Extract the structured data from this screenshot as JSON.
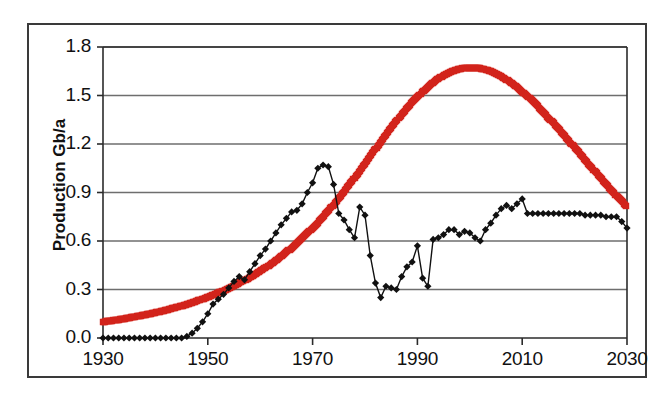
{
  "chart_data": {
    "type": "line",
    "title": "",
    "xlabel": "",
    "ylabel": "Production Gb/a",
    "xlim": [
      1930,
      2030
    ],
    "ylim": [
      0.0,
      1.8
    ],
    "grid": true,
    "legend": "none",
    "xticks": [
      "1930",
      "1950",
      "1970",
      "1990",
      "2010",
      "2030"
    ],
    "xtick_values": [
      1930,
      1950,
      1970,
      1990,
      2010,
      2030
    ],
    "yticks": [
      "0.0",
      "0.3",
      "0.6",
      "0.9",
      "1.2",
      "1.5",
      "1.8"
    ],
    "ytick_values": [
      0.0,
      0.3,
      0.6,
      0.9,
      1.2,
      1.5,
      1.8
    ],
    "series": [
      {
        "name": "model-curve",
        "style": "thick-red-bell-curve",
        "color": "#D2241C",
        "marker": "square",
        "x": [
          1930,
          1931,
          1932,
          1933,
          1934,
          1935,
          1936,
          1937,
          1938,
          1939,
          1940,
          1941,
          1942,
          1943,
          1944,
          1945,
          1946,
          1947,
          1948,
          1949,
          1950,
          1951,
          1952,
          1953,
          1954,
          1955,
          1956,
          1957,
          1958,
          1959,
          1960,
          1961,
          1962,
          1963,
          1964,
          1965,
          1966,
          1967,
          1968,
          1969,
          1970,
          1971,
          1972,
          1973,
          1974,
          1975,
          1976,
          1977,
          1978,
          1979,
          1980,
          1981,
          1982,
          1983,
          1984,
          1985,
          1986,
          1987,
          1988,
          1989,
          1990,
          1991,
          1992,
          1993,
          1994,
          1995,
          1996,
          1997,
          1998,
          1999,
          2000,
          2001,
          2002,
          2003,
          2004,
          2005,
          2006,
          2007,
          2008,
          2009,
          2010,
          2011,
          2012,
          2013,
          2014,
          2015,
          2016,
          2017,
          2018,
          2019,
          2020,
          2021,
          2022,
          2023,
          2024,
          2025,
          2026,
          2027,
          2028,
          2029,
          2030
        ],
        "values": [
          0.1,
          0.104,
          0.109,
          0.114,
          0.119,
          0.125,
          0.131,
          0.137,
          0.143,
          0.15,
          0.157,
          0.165,
          0.173,
          0.181,
          0.19,
          0.199,
          0.209,
          0.219,
          0.23,
          0.241,
          0.253,
          0.266,
          0.279,
          0.293,
          0.308,
          0.323,
          0.34,
          0.357,
          0.375,
          0.394,
          0.414,
          0.435,
          0.457,
          0.48,
          0.505,
          0.531,
          0.558,
          0.586,
          0.616,
          0.647,
          0.68,
          0.714,
          0.75,
          0.787,
          0.825,
          0.865,
          0.906,
          0.948,
          0.991,
          1.035,
          1.079,
          1.124,
          1.169,
          1.214,
          1.258,
          1.301,
          1.343,
          1.383,
          1.422,
          1.459,
          1.493,
          1.525,
          1.554,
          1.58,
          1.604,
          1.624,
          1.641,
          1.654,
          1.664,
          1.67,
          1.673,
          1.672,
          1.668,
          1.66,
          1.649,
          1.635,
          1.618,
          1.598,
          1.576,
          1.551,
          1.524,
          1.495,
          1.464,
          1.432,
          1.398,
          1.363,
          1.327,
          1.291,
          1.254,
          1.216,
          1.178,
          1.14,
          1.102,
          1.064,
          1.026,
          0.989,
          0.952,
          0.916,
          0.88,
          0.845,
          0.811
        ],
        "peak_year": 1994,
        "peak_value": 1.67
      },
      {
        "name": "historical-data",
        "style": "thin-black-line-with-diamond-markers",
        "color": "#111111",
        "marker": "diamond",
        "x": [
          1930,
          1931,
          1932,
          1933,
          1934,
          1935,
          1936,
          1937,
          1938,
          1939,
          1940,
          1941,
          1942,
          1943,
          1944,
          1945,
          1946,
          1947,
          1948,
          1949,
          1950,
          1951,
          1952,
          1953,
          1954,
          1955,
          1956,
          1957,
          1958,
          1959,
          1960,
          1961,
          1962,
          1963,
          1964,
          1965,
          1966,
          1967,
          1968,
          1969,
          1970,
          1971,
          1972,
          1973,
          1974,
          1975,
          1976,
          1977,
          1978,
          1979,
          1980,
          1981,
          1982,
          1983,
          1984,
          1985,
          1986,
          1987,
          1988,
          1989,
          1990,
          1991,
          1992,
          1993,
          1994,
          1995,
          1996,
          1997,
          1998,
          1999,
          2000,
          2001,
          2002,
          2003,
          2004,
          2005,
          2006,
          2007,
          2008,
          2009,
          2010,
          2011,
          2012,
          2013,
          2014,
          2015,
          2016,
          2017,
          2018,
          2019,
          2020,
          2021,
          2022,
          2023,
          2024,
          2025,
          2026,
          2027,
          2028,
          2029,
          2030
        ],
        "values": [
          0.0,
          0.0,
          0.0,
          0.0,
          0.0,
          0.0,
          0.0,
          0.0,
          0.0,
          0.0,
          0.0,
          0.0,
          0.0,
          0.0,
          0.0,
          0.0,
          0.01,
          0.03,
          0.06,
          0.1,
          0.15,
          0.21,
          0.24,
          0.27,
          0.31,
          0.35,
          0.38,
          0.36,
          0.41,
          0.46,
          0.51,
          0.55,
          0.6,
          0.65,
          0.7,
          0.74,
          0.78,
          0.79,
          0.83,
          0.9,
          0.96,
          1.05,
          1.07,
          1.06,
          0.95,
          0.77,
          0.73,
          0.67,
          0.62,
          0.81,
          0.76,
          0.51,
          0.34,
          0.25,
          0.32,
          0.31,
          0.3,
          0.38,
          0.44,
          0.47,
          0.57,
          0.37,
          0.32,
          0.61,
          0.62,
          0.64,
          0.67,
          0.67,
          0.64,
          0.66,
          0.65,
          0.62,
          0.6,
          0.67,
          0.71,
          0.76,
          0.8,
          0.82,
          0.8,
          0.83,
          0.86,
          0.77,
          0.77,
          0.77,
          0.77,
          0.77,
          0.77,
          0.77,
          0.77,
          0.77,
          0.77,
          0.77,
          0.76,
          0.76,
          0.76,
          0.76,
          0.75,
          0.75,
          0.75,
          0.72,
          0.68
        ]
      }
    ]
  },
  "axes": {
    "y_title": "Production Gb/a",
    "y_labels": [
      "1.8",
      "1.5",
      "1.2",
      "0.9",
      "0.6",
      "0.3",
      "0.0"
    ],
    "x_labels": [
      "1930",
      "1950",
      "1970",
      "1990",
      "2010",
      "2030"
    ]
  },
  "colors": {
    "series_red": "#D2241C",
    "series_black": "#111111",
    "gridline": "#6e6e6e",
    "axis": "#2b2b2b",
    "frame": "#3a3a3a",
    "background": "#ffffff"
  }
}
